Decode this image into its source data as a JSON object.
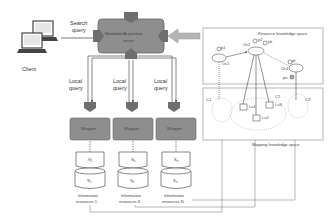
{
  "client": {
    "label": "Client",
    "icon": "laptop-icon"
  },
  "search_query": {
    "line1": "Search",
    "line2": "query"
  },
  "server": {
    "line1": "Mediation/Acquisition",
    "line2": "server"
  },
  "local_query": {
    "line1": "Local",
    "line2": "query"
  },
  "wrappers": [
    {
      "label": "Wrapper"
    },
    {
      "label": "Wrapper"
    },
    {
      "label": "Wrapper"
    }
  ],
  "schemas": [
    {
      "label": "S",
      "sub": "1"
    },
    {
      "label": "S",
      "sub": "k"
    },
    {
      "label": "S",
      "sub": "n"
    }
  ],
  "sources": [
    {
      "label": "S",
      "sub": "1",
      "line1": "Information",
      "line2": "resources 1"
    },
    {
      "label": "S",
      "sub": "k",
      "line1": "Information",
      "line2": "resources K"
    },
    {
      "label": "S",
      "sub": "n",
      "line1": "Information",
      "line2": "resources N"
    }
  ],
  "resource_space": {
    "title": "Resource knowledge space",
    "nodes": [
      {
        "id": "Oc1",
        "prop": "p1"
      },
      {
        "id": "Oc2",
        "prop1": "p2",
        "prop2": "pk"
      },
      {
        "id": "Oc4",
        "prop": "pf",
        "extra": "pn"
      }
    ]
  },
  "mapping_space": {
    "title": "Mapping knowledge space",
    "clusters": [
      "C1",
      "C2",
      "C3"
    ],
    "mappings": [
      "Lu1",
      "Lu2",
      "Lu3"
    ]
  },
  "colors": {
    "box_fill": "#8e8e8e",
    "connector_fill": "#6e6e6e",
    "arrow_fill": "#b5b5b5",
    "line": "#555555",
    "panel_border": "#999999"
  }
}
